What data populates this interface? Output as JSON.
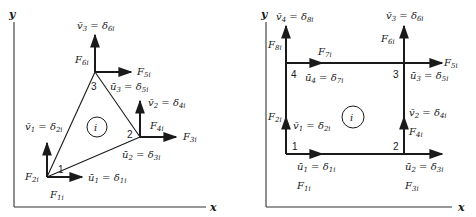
{
  "figure": {
    "colors": {
      "ink": "#1a1a1a",
      "axis": "#333333",
      "background": "#ffffff"
    },
    "left_panel": {
      "element_type": "triangle",
      "axes": {
        "x_label": "x",
        "y_label": "y"
      },
      "element_label": "i",
      "nodes": [
        {
          "id": "1",
          "label": "1"
        },
        {
          "id": "2",
          "label": "2"
        },
        {
          "id": "3",
          "label": "3"
        }
      ],
      "forces": {
        "F1": {
          "main": "F",
          "sub": "1i"
        },
        "F2": {
          "main": "F",
          "sub": "2i"
        },
        "F3": {
          "main": "F",
          "sub": "3i"
        },
        "F4": {
          "main": "F",
          "sub": "4i"
        },
        "F5": {
          "main": "F",
          "sub": "5i"
        },
        "F6": {
          "main": "F",
          "sub": "6i"
        }
      },
      "displacements": {
        "u1": {
          "lhs": "ū",
          "lhs_sub": "1",
          "eq": " = ",
          "rhs": "δ",
          "rhs_sub": "1i"
        },
        "v1": {
          "lhs": "v̄",
          "lhs_sub": "1",
          "eq": " = ",
          "rhs": "δ",
          "rhs_sub": "2i"
        },
        "u2": {
          "lhs": "ū",
          "lhs_sub": "2",
          "eq": " = ",
          "rhs": "δ",
          "rhs_sub": "3i"
        },
        "v2": {
          "lhs": "v̄",
          "lhs_sub": "2",
          "eq": " = ",
          "rhs": "δ",
          "rhs_sub": "4i"
        },
        "u3": {
          "lhs": "ū",
          "lhs_sub": "3",
          "eq": " = ",
          "rhs": "δ",
          "rhs_sub": "5i"
        },
        "v3": {
          "lhs": "v̄",
          "lhs_sub": "3",
          "eq": " = ",
          "rhs": "δ",
          "rhs_sub": "6i"
        }
      }
    },
    "right_panel": {
      "element_type": "rectangle",
      "axes": {
        "x_label": "x",
        "y_label": "y"
      },
      "element_label": "i",
      "nodes": [
        {
          "id": "1",
          "label": "1"
        },
        {
          "id": "2",
          "label": "2"
        },
        {
          "id": "3",
          "label": "3"
        },
        {
          "id": "4",
          "label": "4"
        }
      ],
      "forces": {
        "F1": {
          "main": "F",
          "sub": "1i"
        },
        "F2": {
          "main": "F",
          "sub": "2i"
        },
        "F3": {
          "main": "F",
          "sub": "3i"
        },
        "F4": {
          "main": "F",
          "sub": "4i"
        },
        "F5": {
          "main": "F",
          "sub": "5i"
        },
        "F6": {
          "main": "F",
          "sub": "6i"
        },
        "F7": {
          "main": "F",
          "sub": "7i"
        },
        "F8": {
          "main": "F",
          "sub": "8i"
        }
      },
      "displacements": {
        "u1": {
          "lhs": "ū",
          "lhs_sub": "1",
          "eq": " = ",
          "rhs": "δ",
          "rhs_sub": "1i"
        },
        "v1": {
          "lhs": "v̄",
          "lhs_sub": "1",
          "eq": " = ",
          "rhs": "δ",
          "rhs_sub": "2i"
        },
        "u2": {
          "lhs": "ū",
          "lhs_sub": "2",
          "eq": " = ",
          "rhs": "δ",
          "rhs_sub": "3i"
        },
        "v2": {
          "lhs": "v̄",
          "lhs_sub": "2",
          "eq": " = ",
          "rhs": "δ",
          "rhs_sub": "4i"
        },
        "u3": {
          "lhs": "ū",
          "lhs_sub": "3",
          "eq": " = ",
          "rhs": "δ",
          "rhs_sub": "5i"
        },
        "v3": {
          "lhs": "v̄",
          "lhs_sub": "3",
          "eq": " = ",
          "rhs": "δ",
          "rhs_sub": "6i"
        },
        "u4": {
          "lhs": "ū",
          "lhs_sub": "4",
          "eq": " = ",
          "rhs": "δ",
          "rhs_sub": "7i"
        },
        "v4": {
          "lhs": "v̄",
          "lhs_sub": "4",
          "eq": " = ",
          "rhs": "δ",
          "rhs_sub": "8i"
        }
      }
    }
  }
}
